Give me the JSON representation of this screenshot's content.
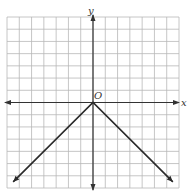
{
  "chart_data": {
    "type": "line",
    "title": "",
    "xlabel": "x",
    "ylabel": "y",
    "origin_label": "O",
    "xlim": [
      -7,
      7
    ],
    "ylim": [
      -7,
      7
    ],
    "grid": true,
    "grid_step": 1,
    "legend": null,
    "series": [
      {
        "name": "y = -|x|",
        "points": [
          [
            -6.5,
            -6.5
          ],
          [
            0,
            0
          ],
          [
            6.5,
            -6.5
          ]
        ],
        "arrows_at_ends": true
      }
    ]
  },
  "labels": {
    "x_axis": "x",
    "y_axis": "y",
    "origin": "O"
  },
  "colors": {
    "grid": "#b8b8b8",
    "axis": "#333333",
    "line": "#2a2a2a",
    "background": "#ffffff"
  }
}
